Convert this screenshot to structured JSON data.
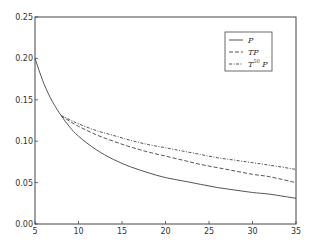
{
  "chart_data": {
    "type": "line",
    "title": "",
    "xlabel": "",
    "ylabel": "",
    "xlim": [
      5,
      35
    ],
    "ylim": [
      0.0,
      0.25
    ],
    "grid": false,
    "legend_position": "upper right",
    "x_ticks": [
      "5",
      "10",
      "15",
      "20",
      "25",
      "30",
      "35"
    ],
    "y_ticks": [
      "0.00",
      "0.05",
      "0.10",
      "0.15",
      "0.20",
      "0.25"
    ],
    "x": [
      5,
      6,
      7,
      8,
      9,
      10,
      12,
      14,
      16,
      18,
      20,
      22,
      24,
      26,
      28,
      30,
      32,
      35
    ],
    "series": [
      {
        "name": "P",
        "style": "solid",
        "values": [
          0.2,
          0.17,
          0.148,
          0.131,
          0.117,
          0.106,
          0.09,
          0.078,
          0.069,
          0.062,
          0.056,
          0.052,
          0.048,
          0.044,
          0.041,
          0.038,
          0.036,
          0.031
        ]
      },
      {
        "name": "TP",
        "style": "dashed",
        "values": [
          null,
          null,
          null,
          0.131,
          0.124,
          0.118,
          0.108,
          0.1,
          0.093,
          0.087,
          0.082,
          0.077,
          0.072,
          0.068,
          0.064,
          0.06,
          0.057,
          0.05
        ]
      },
      {
        "name": "T^50 P",
        "style": "dash-dot",
        "values": [
          null,
          null,
          null,
          0.131,
          0.126,
          0.121,
          0.113,
          0.107,
          0.101,
          0.096,
          0.092,
          0.088,
          0.084,
          0.08,
          0.077,
          0.074,
          0.071,
          0.066
        ]
      }
    ]
  },
  "legend": {
    "items": [
      {
        "label": "P",
        "style": "solid"
      },
      {
        "label": "TP",
        "style": "dashed"
      },
      {
        "label_base": "T",
        "label_sup": "50",
        "label_tail": " P",
        "style": "dash-dot"
      }
    ]
  },
  "colors": {
    "line": "#555555",
    "axes": "#444444",
    "text": "#333333"
  }
}
